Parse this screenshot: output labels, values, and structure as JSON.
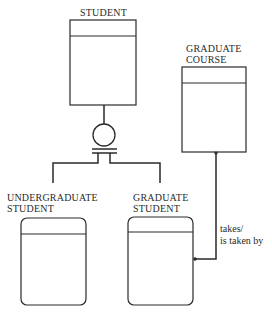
{
  "diagram": {
    "type": "entity-relationship (subtype)",
    "entities": [
      {
        "id": "student",
        "label_lines": [
          "STUDENT"
        ],
        "shape": "square-corner box"
      },
      {
        "id": "graduate_course",
        "label_lines": [
          "GRADUATE",
          "COURSE"
        ],
        "shape": "square-corner box"
      },
      {
        "id": "undergraduate_student",
        "label_lines": [
          "UNDERGRADUATE",
          "STUDENT"
        ],
        "shape": "rounded box"
      },
      {
        "id": "graduate_student",
        "label_lines": [
          "GRADUATE",
          "STUDENT"
        ],
        "shape": "rounded box"
      }
    ],
    "subtype_relation": {
      "supertype": "STUDENT",
      "subtypes": [
        "UNDERGRADUATE STUDENT",
        "GRADUATE STUDENT"
      ],
      "symbol": "circle with double bar"
    },
    "relationship": {
      "from": "GRADUATE STUDENT",
      "to": "GRADUATE COURSE",
      "label_lines": [
        "takes/",
        "is taken by"
      ]
    }
  },
  "colors": {
    "ink": "#2a2a2a",
    "background": "#ffffff"
  }
}
